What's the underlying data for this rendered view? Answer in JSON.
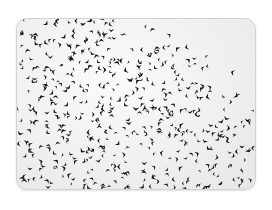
{
  "image": {
    "subject": "flock of birds (murmuration) against a pale sky",
    "frame": "rounded photo card",
    "colors": {
      "sky": "#f0f0f0",
      "birds": "#141414",
      "border": "#d2d2d2",
      "page_background": "#ffffff"
    },
    "flock": {
      "bird_count": 520,
      "seed": 20240611
    }
  }
}
